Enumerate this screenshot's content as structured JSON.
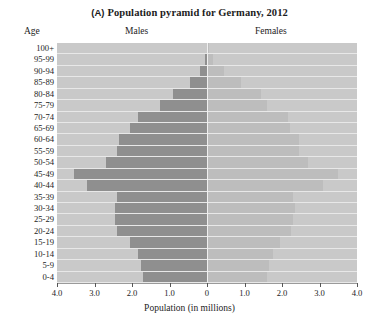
{
  "figure": {
    "panel_tag": "(A)",
    "title": "Population pyramid for Germany, 2012",
    "headers": {
      "age": "Age",
      "left": "Males",
      "right": "Females"
    }
  },
  "chart_data": {
    "type": "bar",
    "subtype": "population-pyramid",
    "title": "(A) Population pyramid for Germany, 2012",
    "xlabel": "Population (in millions)",
    "ylabel": "Age",
    "xlim": [
      -4.0,
      4.0
    ],
    "xticks": [
      4.0,
      3.0,
      2.0,
      1.0,
      0,
      1.0,
      2.0,
      3.0,
      4.0
    ],
    "xtick_labels": [
      "4.0",
      "3.0",
      "2.0",
      "1.0",
      "0",
      "1.0",
      "2.0",
      "3.0",
      "4.0"
    ],
    "grid": false,
    "legend": "none",
    "left_side_label": "Males",
    "right_side_label": "Females",
    "categories": [
      "100+",
      "95-99",
      "90-94",
      "85-89",
      "80-84",
      "75-79",
      "70-74",
      "65-69",
      "60-64",
      "55-59",
      "50-54",
      "45-49",
      "40-44",
      "35-39",
      "30-34",
      "25-29",
      "20-24",
      "15-19",
      "10-14",
      "5-9",
      "0-4"
    ],
    "series": [
      {
        "name": "Males",
        "side": "left",
        "color": "#8f8f8f",
        "values": [
          0.01,
          0.05,
          0.18,
          0.45,
          0.9,
          1.25,
          1.85,
          2.05,
          2.35,
          2.4,
          2.7,
          3.55,
          3.2,
          2.4,
          2.45,
          2.45,
          2.4,
          2.05,
          1.85,
          1.75,
          1.7
        ]
      },
      {
        "name": "Females",
        "side": "right",
        "color": "#bdbdbd",
        "values": [
          0.04,
          0.17,
          0.45,
          0.9,
          1.45,
          1.6,
          2.15,
          2.2,
          2.45,
          2.45,
          2.7,
          3.5,
          3.1,
          2.3,
          2.35,
          2.3,
          2.25,
          1.95,
          1.75,
          1.65,
          1.6
        ]
      }
    ],
    "units": "millions"
  },
  "colors": {
    "plot_background": "#c9c9c9",
    "male_bar": "#a6a6a6",
    "female_bar": "#c2c2c2",
    "row_separator": "#e8e8e8",
    "axis": "#555555",
    "text": "#1c1c1c"
  }
}
